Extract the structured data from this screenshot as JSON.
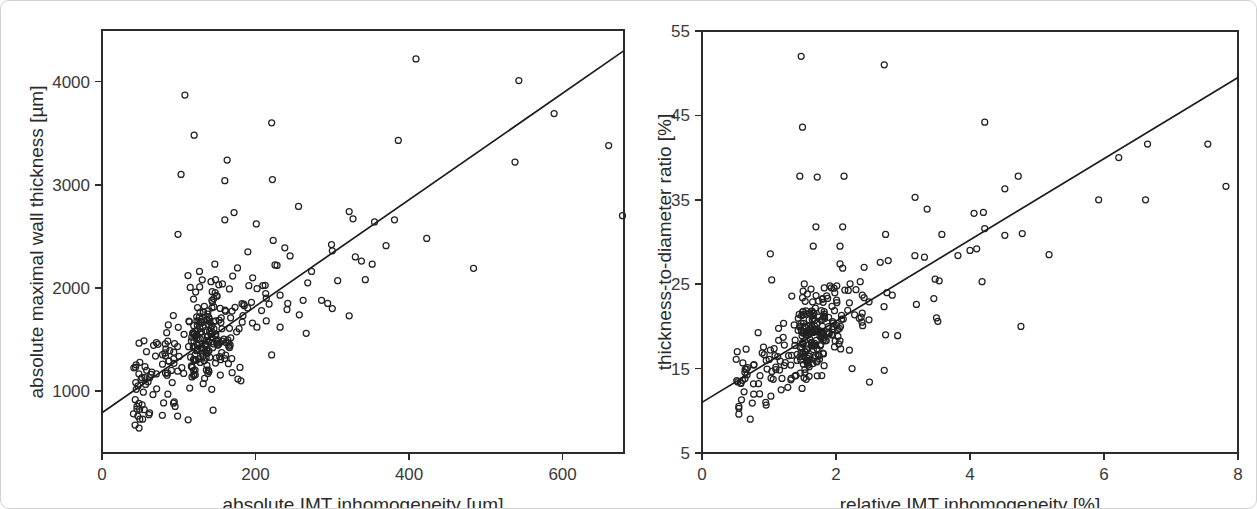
{
  "figure": {
    "panel_count": 2,
    "marker_style": "open-circle",
    "line_color": "#1c1c1c",
    "marker_color": "#222222",
    "card_border_color": "#d2d2d2",
    "background": "#ffffff"
  },
  "chart_data": [
    {
      "type": "scatter",
      "panel": "left",
      "title": "",
      "xlabel": "absolute IMT inhomogeneity [µm]",
      "ylabel": "absolute maximal wall thickness [µm]",
      "xlim": [
        0,
        680
      ],
      "ylim": [
        400,
        4500
      ],
      "xticks": [
        0,
        200,
        400,
        600
      ],
      "yticks": [
        1000,
        2000,
        3000,
        4000
      ],
      "xticklabels": [
        "0",
        "200",
        "400",
        "600"
      ],
      "yticklabels": [
        "1000",
        "2000",
        "3000",
        "4000"
      ],
      "grid": false,
      "legend": "none",
      "n_points": 330,
      "trendline": {
        "type": "linear",
        "x_start": 0,
        "y_start": 790,
        "x_end": 680,
        "y_end": 4300
      },
      "cluster": {
        "x_mean": 115,
        "x_sd": 55,
        "x_min": 40,
        "x_max": 300,
        "residual_sd": 230,
        "seed": 20112
      },
      "points": [
        [
          52,
          1130
        ],
        [
          60,
          1090
        ],
        [
          48,
          880
        ],
        [
          55,
          820
        ],
        [
          62,
          790
        ],
        [
          108,
          3870
        ],
        [
          120,
          3480
        ],
        [
          163,
          3240
        ],
        [
          103,
          3100
        ],
        [
          221,
          3600
        ],
        [
          160,
          3040
        ],
        [
          222,
          3050
        ],
        [
          409,
          4220
        ],
        [
          386,
          3430
        ],
        [
          543,
          4010
        ],
        [
          589,
          3690
        ],
        [
          660,
          3380
        ],
        [
          538,
          3220
        ],
        [
          678,
          2700
        ],
        [
          484,
          2190
        ],
        [
          99,
          2520
        ],
        [
          256,
          2790
        ],
        [
          172,
          2730
        ],
        [
          160,
          2660
        ],
        [
          201,
          2620
        ],
        [
          355,
          2640
        ],
        [
          381,
          2660
        ],
        [
          423,
          2480
        ],
        [
          322,
          2740
        ],
        [
          327,
          2670
        ],
        [
          127,
          2160
        ],
        [
          112,
          2120
        ],
        [
          147,
          2230
        ],
        [
          190,
          2350
        ],
        [
          223,
          2460
        ],
        [
          245,
          2310
        ],
        [
          273,
          2160
        ],
        [
          299,
          2420
        ],
        [
          300,
          2360
        ],
        [
          330,
          2300
        ],
        [
          338,
          2260
        ],
        [
          352,
          2230
        ],
        [
          370,
          2410
        ],
        [
          268,
          2050
        ],
        [
          307,
          2070
        ],
        [
          343,
          2080
        ],
        [
          122,
          1960
        ],
        [
          142,
          2060
        ],
        [
          148,
          2080
        ],
        [
          166,
          1990
        ],
        [
          214,
          1900
        ],
        [
          232,
          1930
        ],
        [
          242,
          1850
        ],
        [
          262,
          1880
        ],
        [
          286,
          1880
        ],
        [
          294,
          1850
        ],
        [
          300,
          1800
        ],
        [
          322,
          1730
        ],
        [
          257,
          1740
        ],
        [
          241,
          1790
        ],
        [
          214,
          1680
        ],
        [
          196,
          1660
        ],
        [
          232,
          1620
        ],
        [
          221,
          1350
        ],
        [
          266,
          1560
        ],
        [
          181,
          1100
        ]
      ]
    },
    {
      "type": "scatter",
      "panel": "right",
      "title": "",
      "xlabel": "relative IMT inhomogeneity [%]",
      "ylabel": "thickness-to-diameter ratio [%]",
      "xlim": [
        0,
        8
      ],
      "ylim": [
        5,
        55
      ],
      "xticks": [
        0,
        2,
        4,
        6,
        8
      ],
      "yticks": [
        5,
        15,
        25,
        35,
        45,
        55
      ],
      "xticklabels": [
        "0",
        "2",
        "4",
        "6",
        "8"
      ],
      "yticklabels": [
        "5",
        "15",
        "25",
        "35",
        "45",
        "55"
      ],
      "grid": false,
      "legend": "none",
      "n_points": 330,
      "trendline": {
        "type": "linear",
        "x_start": 0,
        "y_start": 11.0,
        "x_end": 8,
        "y_end": 49.5
      },
      "cluster": {
        "x_mean": 1.45,
        "x_sd": 0.55,
        "x_min": 0.5,
        "x_max": 3.2,
        "residual_sd": 2.5,
        "seed": 77341
      },
      "points": [
        [
          0.55,
          9.6
        ],
        [
          0.72,
          9.0
        ],
        [
          1.02,
          17.2
        ],
        [
          0.86,
          12.0
        ],
        [
          0.95,
          11.0
        ],
        [
          1.48,
          52.0
        ],
        [
          2.72,
          51.0
        ],
        [
          1.5,
          43.6
        ],
        [
          1.46,
          37.8
        ],
        [
          1.72,
          37.7
        ],
        [
          2.12,
          37.8
        ],
        [
          4.22,
          44.2
        ],
        [
          4.72,
          37.8
        ],
        [
          4.52,
          36.3
        ],
        [
          6.22,
          40.0
        ],
        [
          6.65,
          41.6
        ],
        [
          7.55,
          41.6
        ],
        [
          7.82,
          36.6
        ],
        [
          5.92,
          35.0
        ],
        [
          6.62,
          35.0
        ],
        [
          1.02,
          28.6
        ],
        [
          1.7,
          31.8
        ],
        [
          2.1,
          31.8
        ],
        [
          1.66,
          29.5
        ],
        [
          2.06,
          29.5
        ],
        [
          2.74,
          30.9
        ],
        [
          3.18,
          35.3
        ],
        [
          3.36,
          33.9
        ],
        [
          3.58,
          30.9
        ],
        [
          4.06,
          33.4
        ],
        [
          4.2,
          33.5
        ],
        [
          4.22,
          31.6
        ],
        [
          4.52,
          30.8
        ],
        [
          4.78,
          31.0
        ],
        [
          5.18,
          28.5
        ],
        [
          1.04,
          25.5
        ],
        [
          2.66,
          27.6
        ],
        [
          2.78,
          27.8
        ],
        [
          2.1,
          26.9
        ],
        [
          2.06,
          27.4
        ],
        [
          2.42,
          27.0
        ],
        [
          3.32,
          28.2
        ],
        [
          3.82,
          28.4
        ],
        [
          4.0,
          29.0
        ],
        [
          4.1,
          29.2
        ],
        [
          3.48,
          25.6
        ],
        [
          3.54,
          25.4
        ],
        [
          4.18,
          25.3
        ],
        [
          1.34,
          23.6
        ],
        [
          1.5,
          23.4
        ],
        [
          1.74,
          23.0
        ],
        [
          1.8,
          23.3
        ],
        [
          2.2,
          22.8
        ],
        [
          2.42,
          23.4
        ],
        [
          2.76,
          24.0
        ],
        [
          2.84,
          23.7
        ],
        [
          3.2,
          22.6
        ],
        [
          3.46,
          23.3
        ],
        [
          3.5,
          21.0
        ],
        [
          3.52,
          20.6
        ],
        [
          2.5,
          13.4
        ],
        [
          2.72,
          14.8
        ],
        [
          4.76,
          20.0
        ],
        [
          2.92,
          18.9
        ],
        [
          2.74,
          19.0
        ],
        [
          2.24,
          15.0
        ]
      ]
    }
  ],
  "left_panel": {
    "x_axis": {
      "title": "absolute IMT inhomogeneity [µm]",
      "ticks": [
        "0",
        "200",
        "400",
        "600"
      ]
    },
    "y_axis": {
      "title": "absolute maximal wall thickness [µm]",
      "ticks": [
        "4000",
        "3000",
        "2000",
        "1000"
      ]
    }
  },
  "right_panel": {
    "x_axis": {
      "title": "relative IMT inhomogeneity [%]",
      "ticks": [
        "0",
        "2",
        "4",
        "6",
        "8"
      ]
    },
    "y_axis": {
      "title": "thickness-to-diameter ratio [%]",
      "ticks": [
        "55",
        "45",
        "35",
        "25",
        "15",
        "5"
      ]
    }
  }
}
